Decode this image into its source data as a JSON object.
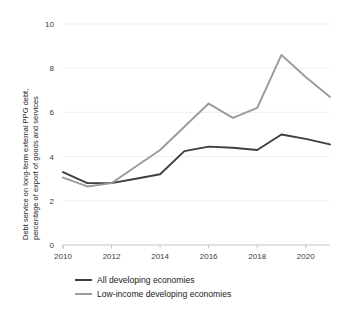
{
  "chart_data": {
    "type": "line",
    "title": "",
    "xlabel": "",
    "ylabel": "Debt service on long-term external PPG debt, percentage of export of goods and services",
    "ylabel_line1": "Debt service on long-term external PPG debt,",
    "ylabel_line2": "percentage of export of goods and services",
    "x": [
      2010,
      2011,
      2012,
      2013,
      2014,
      2015,
      2016,
      2017,
      2018,
      2019,
      2020,
      2021
    ],
    "xlim": [
      2010,
      2021
    ],
    "ylim": [
      0,
      10
    ],
    "xticks": [
      2010,
      2012,
      2014,
      2016,
      2018,
      2020
    ],
    "xtick_labels": [
      "2010",
      "2012",
      "2014",
      "2016",
      "2018",
      "2020"
    ],
    "yticks": [
      0,
      2,
      4,
      6,
      8,
      10
    ],
    "ytick_labels": [
      "0",
      "2",
      "4",
      "6",
      "8",
      "10"
    ],
    "grid": "horizontal",
    "legend_position": "bottom-left",
    "series": [
      {
        "name": "All developing economies",
        "color": "#3f3f3f",
        "values": [
          3.3,
          2.8,
          2.8,
          3.0,
          3.2,
          4.25,
          4.45,
          4.4,
          4.3,
          5.0,
          4.8,
          4.55
        ]
      },
      {
        "name": "Low-income developing economies",
        "color": "#9b9b9b",
        "values": [
          3.05,
          2.65,
          2.8,
          3.55,
          4.3,
          5.35,
          6.4,
          5.75,
          6.2,
          8.6,
          7.6,
          6.7
        ]
      }
    ]
  },
  "legend": {
    "items": [
      {
        "label": "All developing economies",
        "color": "#3f3f3f"
      },
      {
        "label": "Low-income developing economies",
        "color": "#9b9b9b"
      }
    ]
  }
}
